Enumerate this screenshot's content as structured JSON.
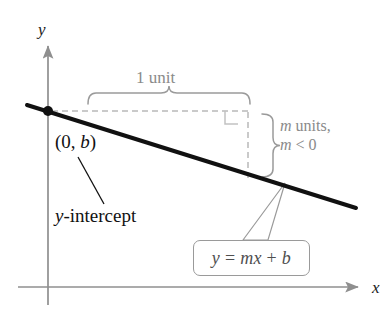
{
  "figure": {
    "kind": "coordinate-diagram",
    "background": "#ffffff",
    "width": 392,
    "height": 313,
    "axes": {
      "color": "#8f8f8f",
      "x_label": "x",
      "y_label": "y",
      "origin": {
        "x": 48,
        "y": 287
      },
      "x_axis": {
        "x1": 18,
        "y1": 287,
        "x2": 358,
        "y2": 287
      },
      "y_axis": {
        "x1": 48,
        "y1": 305,
        "x2": 48,
        "y2": 46
      },
      "x_label_pos": {
        "x": 372,
        "y": 278
      },
      "y_label_pos": {
        "x": 38,
        "y": 20
      }
    },
    "line": {
      "label": "y = mx + b",
      "color": "#111111",
      "width": 4,
      "x1": 27,
      "y1": 105,
      "x2": 356,
      "y2": 208
    },
    "intercept_point": {
      "name": "y-intercept point",
      "x": 48,
      "y": 111,
      "radius": 5,
      "color": "#111111"
    },
    "point_label": {
      "prefix": "(0, ",
      "variable": "b",
      "suffix": ")",
      "x": 55,
      "y": 131
    },
    "intercept_caption": {
      "variable": "y",
      "text": "-intercept",
      "x": 55,
      "y": 205
    },
    "intercept_leader": {
      "x1": 104,
      "y1": 204,
      "x2": 78,
      "y2": 157,
      "color": "#111111"
    },
    "run_brace": {
      "label": "1 unit",
      "color": "#9a9a9a",
      "x_start": 88,
      "x_end": 250,
      "y_base": 104,
      "peak_y": 93,
      "label_x": 136,
      "label_y": 68
    },
    "rise_brace": {
      "line1_prefix": "m",
      "line1_text": " units,",
      "line2_prefix": "m",
      "line2_text": " < 0",
      "color": "#9a9a9a",
      "y_start": 114,
      "y_end": 177,
      "x_base": 262,
      "peak_x": 273,
      "label_x": 280,
      "label_y": 117
    },
    "dashed": {
      "color": "#b9b9b9",
      "horizontal": {
        "x1": 52,
        "y1": 111,
        "x2": 250,
        "y2": 111
      },
      "vertical": {
        "x1": 248,
        "y1": 112,
        "x2": 248,
        "y2": 178
      }
    },
    "right_angle_mark": {
      "color": "#c2c2c2",
      "x": 225,
      "y": 111,
      "size": 13
    },
    "equation_callout": {
      "text_prefix": "y",
      "text_mid": " = ",
      "text_m": "m",
      "text_x": "x",
      "text_suffix": " + ",
      "text_b": "b",
      "full_text": "y = mx + b",
      "border_color": "#9a9a9a",
      "box": {
        "x": 193,
        "y": 240,
        "width": 117,
        "height": 36
      },
      "tail": {
        "tip_x": 285,
        "tip_y": 183,
        "base1_x": 243,
        "base1_y": 240,
        "base2_x": 268,
        "base2_y": 240
      }
    }
  }
}
